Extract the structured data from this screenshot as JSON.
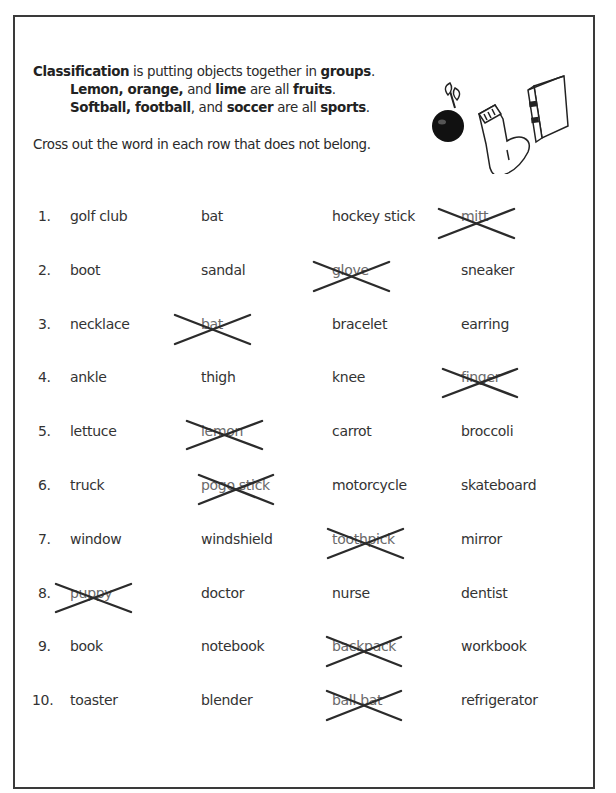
{
  "intro": {
    "line1": [
      {
        "text": "Classification",
        "bold": true
      },
      {
        "text": " is putting objects together in ",
        "bold": false
      },
      {
        "text": "groups",
        "bold": true
      },
      {
        "text": ".",
        "bold": false
      }
    ],
    "line2": [
      {
        "text": "Lemon, orange,",
        "bold": true
      },
      {
        "text": " and ",
        "bold": false
      },
      {
        "text": "lime",
        "bold": true
      },
      {
        "text": " are all ",
        "bold": false
      },
      {
        "text": "fruits",
        "bold": true
      },
      {
        "text": ".",
        "bold": false
      }
    ],
    "line3": [
      {
        "text": "Softball, football",
        "bold": true
      },
      {
        "text": ", and ",
        "bold": false
      },
      {
        "text": "soccer",
        "bold": true
      },
      {
        "text": " are all ",
        "bold": false
      },
      {
        "text": "sports",
        "bold": true
      },
      {
        "text": ".",
        "bold": false
      }
    ],
    "instruction": "Cross out the word in each row that does not belong."
  },
  "illustrations": [
    "apple-icon",
    "sock-icon",
    "book-icon"
  ],
  "rows": [
    {
      "num": "1.",
      "words": [
        "golf club",
        "bat",
        "hockey stick",
        "mitt"
      ],
      "crossed": 3
    },
    {
      "num": "2.",
      "words": [
        "boot",
        "sandal",
        "glove",
        "sneaker"
      ],
      "crossed": 2
    },
    {
      "num": "3.",
      "words": [
        "necklace",
        "bat",
        "bracelet",
        "earring"
      ],
      "crossed": 1
    },
    {
      "num": "4.",
      "words": [
        "ankle",
        "thigh",
        "knee",
        "finger"
      ],
      "crossed": 3
    },
    {
      "num": "5.",
      "words": [
        "lettuce",
        "lemon",
        "carrot",
        "broccoli"
      ],
      "crossed": 1
    },
    {
      "num": "6.",
      "words": [
        "truck",
        "pogo stick",
        "motorcycle",
        "skateboard"
      ],
      "crossed": 1
    },
    {
      "num": "7.",
      "words": [
        "window",
        "windshield",
        "toothpick",
        "mirror"
      ],
      "crossed": 2
    },
    {
      "num": "8.",
      "words": [
        "puppy",
        "doctor",
        "nurse",
        "dentist"
      ],
      "crossed": 0
    },
    {
      "num": "9.",
      "words": [
        "book",
        "notebook",
        "backpack",
        "workbook"
      ],
      "crossed": 2
    },
    {
      "num": "10.",
      "words": [
        "toaster",
        "blender",
        "ball bat",
        "refrigerator"
      ],
      "crossed": 2
    }
  ],
  "cross_marks": [
    {
      "row": 1,
      "x": 439,
      "y": 209,
      "w": 75,
      "h": 29
    },
    {
      "row": 2,
      "x": 314,
      "y": 262,
      "w": 75,
      "h": 29
    },
    {
      "row": 3,
      "x": 175,
      "y": 315,
      "w": 75,
      "h": 29
    },
    {
      "row": 4,
      "x": 443,
      "y": 369,
      "w": 74,
      "h": 28
    },
    {
      "row": 5,
      "x": 187,
      "y": 421,
      "w": 75,
      "h": 28
    },
    {
      "row": 6,
      "x": 199,
      "y": 475,
      "w": 74,
      "h": 29
    },
    {
      "row": 7,
      "x": 328,
      "y": 529,
      "w": 75,
      "h": 29
    },
    {
      "row": 8,
      "x": 56,
      "y": 584,
      "w": 75,
      "h": 28
    },
    {
      "row": 9,
      "x": 327,
      "y": 637,
      "w": 74,
      "h": 29
    },
    {
      "row": 10,
      "x": 327,
      "y": 691,
      "w": 74,
      "h": 29
    }
  ],
  "colors": {
    "ink": "#2a2a2a",
    "cross": "#2b2b2b",
    "border": "#3a3a3a"
  }
}
